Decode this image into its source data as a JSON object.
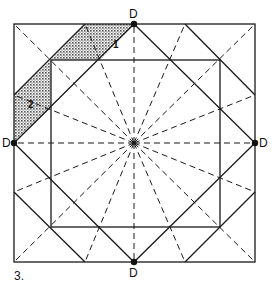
{
  "figure": {
    "number_label": "3.",
    "point_label": "D",
    "region_labels": [
      "1",
      "2"
    ],
    "colors": {
      "ink": "#1a1a1a",
      "paper": "#ffffff",
      "shade": "#555555"
    }
  }
}
